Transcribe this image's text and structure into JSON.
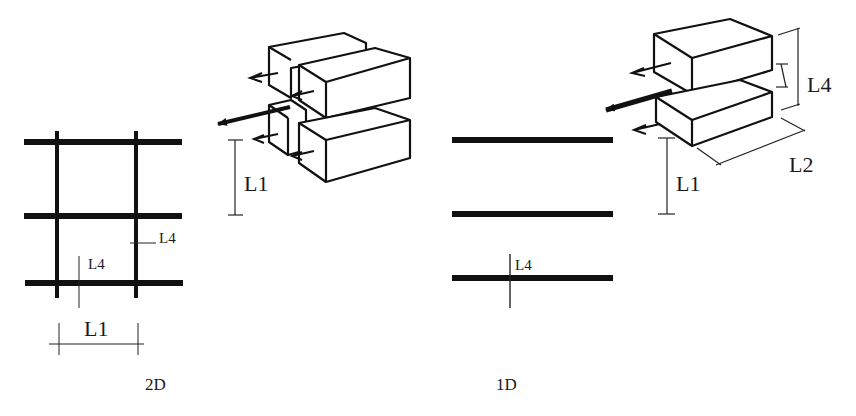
{
  "diagram": {
    "panels": [
      {
        "id": "2d",
        "caption": "2D",
        "grid": {
          "horizontal_bars": 3,
          "vertical_bars": 2
        },
        "labels": {
          "spacing": "L1",
          "bar_thickness_vertical": "L4",
          "bar_thickness_horizontal": "L4"
        }
      },
      {
        "id": "1d",
        "caption": "1D",
        "grid": {
          "horizontal_bars": 3,
          "vertical_bars": 0
        },
        "labels": {
          "bar_thickness": "L4"
        }
      }
    ],
    "blocks_2d": {
      "label_spacing": "L1"
    },
    "blocks_1d": {
      "label_height": "L4",
      "label_length": "L2",
      "label_spacing": "L1"
    }
  },
  "colors": {
    "ink": "#111111",
    "background": "#ffffff"
  }
}
